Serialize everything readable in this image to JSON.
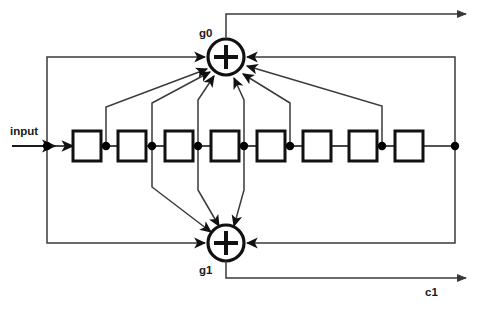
{
  "diagram": {
    "type": "block-diagram",
    "colors": {
      "stroke": "#1a1a1a",
      "line": "#3a3a3a",
      "background": "#ffffff",
      "node": "#000000"
    },
    "labels": {
      "input": "input",
      "g0": "g0",
      "g1": "g1",
      "c1": "c1"
    },
    "adders": [
      {
        "id": "g0",
        "label": "g0",
        "symbol": "+",
        "cx": 226,
        "cy": 57,
        "r": 18
      },
      {
        "id": "g1",
        "label": "g1",
        "symbol": "+",
        "cx": 226,
        "cy": 243,
        "r": 18
      }
    ],
    "registers": [
      {
        "index": 1,
        "x": 73,
        "y": 131,
        "w": 28,
        "h": 30
      },
      {
        "index": 2,
        "x": 118,
        "y": 131,
        "w": 28,
        "h": 30
      },
      {
        "index": 3,
        "x": 165,
        "y": 131,
        "w": 28,
        "h": 30
      },
      {
        "index": 4,
        "x": 211,
        "y": 131,
        "w": 28,
        "h": 30
      },
      {
        "index": 5,
        "x": 257,
        "y": 131,
        "w": 28,
        "h": 30
      },
      {
        "index": 6,
        "x": 303,
        "y": 131,
        "w": 28,
        "h": 30
      },
      {
        "index": 7,
        "x": 349,
        "y": 131,
        "w": 28,
        "h": 30
      },
      {
        "index": 8,
        "x": 395,
        "y": 131,
        "w": 28,
        "h": 30
      }
    ],
    "register_count": 8,
    "nodes": [
      {
        "id": "input-node",
        "cx": 47,
        "cy": 146
      },
      {
        "id": "tap-1",
        "cx": 106,
        "cy": 146
      },
      {
        "id": "tap-2",
        "cx": 152,
        "cy": 146
      },
      {
        "id": "tap-3",
        "cx": 198,
        "cy": 146
      },
      {
        "id": "tap-4",
        "cx": 244,
        "cy": 146
      },
      {
        "id": "tap-5",
        "cx": 290,
        "cy": 146
      },
      {
        "id": "tap-7",
        "cx": 382,
        "cy": 146
      },
      {
        "id": "output-node",
        "cx": 455,
        "cy": 146
      }
    ],
    "taps_to_g0": [
      106,
      152,
      198,
      244,
      290,
      382,
      455
    ],
    "taps_to_g1": [
      47,
      152,
      198,
      244,
      455
    ],
    "outputs": [
      {
        "id": "c0",
        "label": "",
        "from": "g0",
        "y": 14,
        "to_x": 470
      },
      {
        "id": "c1",
        "label": "c1",
        "from": "g1",
        "y": 278,
        "to_x": 470
      }
    ]
  }
}
